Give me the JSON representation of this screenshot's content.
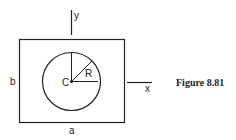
{
  "figure": {
    "caption": "Figure 8.81",
    "labels": {
      "y_axis": "y",
      "x_axis": "x",
      "height": "b",
      "width": "a",
      "center": "C",
      "radius": "R"
    },
    "colors": {
      "stroke": "#222222",
      "background": "#ffffff"
    }
  }
}
